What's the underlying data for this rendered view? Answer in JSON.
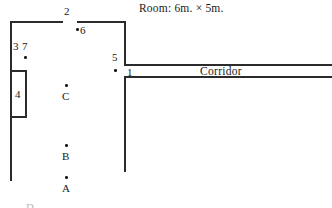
{
  "title": {
    "text": "Room: 6m. × 5m."
  },
  "corridor": {
    "label": "Corridor"
  },
  "markers": [
    {
      "id": "m2",
      "label": "2"
    },
    {
      "id": "m6",
      "label": "6"
    },
    {
      "id": "m3",
      "label": "3"
    },
    {
      "id": "m7",
      "label": "7"
    },
    {
      "id": "m4",
      "label": "4"
    },
    {
      "id": "m5",
      "label": "5"
    },
    {
      "id": "m1",
      "label": "1"
    }
  ],
  "points": [
    {
      "id": "pC",
      "label": "C"
    },
    {
      "id": "pB",
      "label": "B"
    },
    {
      "id": "pA",
      "label": "A"
    },
    {
      "id": "pD",
      "label": "D"
    }
  ],
  "colors": {
    "wall": "#2b2b2b",
    "text": "#1a1a1a",
    "background": "#ffffff",
    "cropped_text": "#b9b9b9"
  }
}
